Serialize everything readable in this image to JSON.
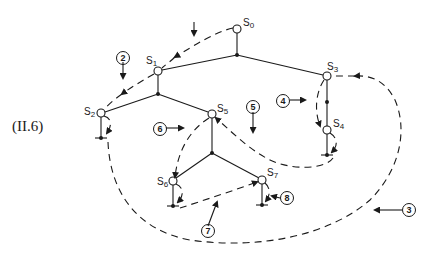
{
  "figure": {
    "equation_label": "(II.6)",
    "nodes": [
      {
        "id": "s0",
        "name": "S",
        "sub": "0"
      },
      {
        "id": "s1",
        "name": "S",
        "sub": "1"
      },
      {
        "id": "s2",
        "name": "S",
        "sub": "2"
      },
      {
        "id": "s3",
        "name": "S",
        "sub": "3"
      },
      {
        "id": "s4",
        "name": "S",
        "sub": "4"
      },
      {
        "id": "s5",
        "name": "S",
        "sub": "5"
      },
      {
        "id": "s6",
        "name": "S",
        "sub": "6"
      },
      {
        "id": "s7",
        "name": "S",
        "sub": "7"
      }
    ],
    "steps": [
      "2",
      "3",
      "4",
      "5",
      "6",
      "7",
      "8"
    ],
    "colors": {
      "ink": "#1a1a1a",
      "background": "#ffffff"
    }
  }
}
